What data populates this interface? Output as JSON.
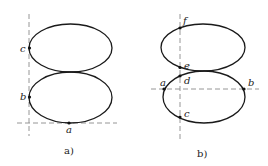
{
  "figures": [
    {
      "caption": "a)",
      "points": {
        "a": "a",
        "b": "b",
        "c": "c"
      }
    },
    {
      "caption": "b)",
      "points": {
        "a": "a",
        "b": "b",
        "c": "c",
        "d": "d",
        "e": "e",
        "f": "f"
      }
    }
  ],
  "colors": {
    "curve": "#1a1a1a",
    "axis": "#8a8a8a"
  }
}
